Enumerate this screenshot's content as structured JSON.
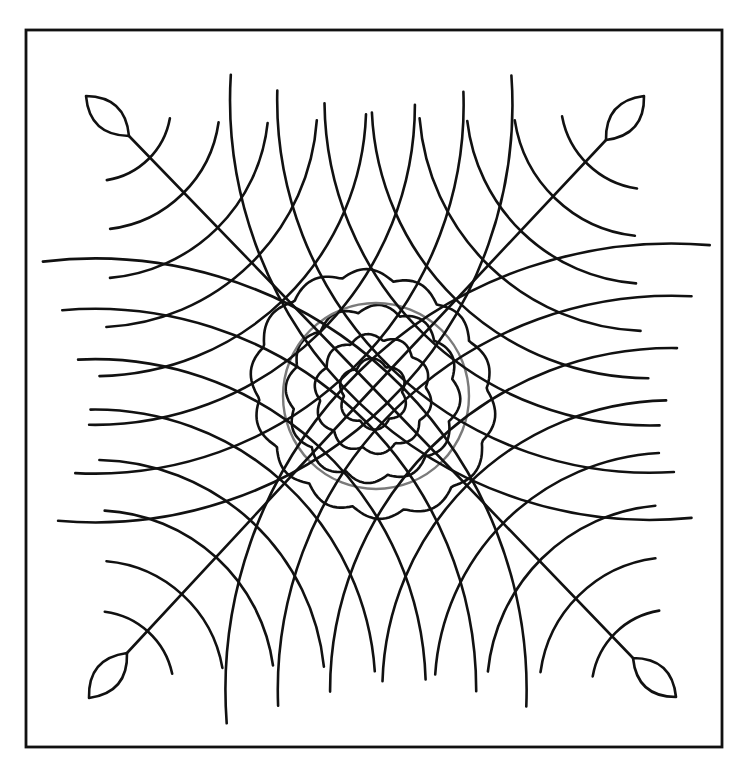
{
  "colors": {
    "line": "#111111",
    "circle": "#7a7a7a",
    "background": "#ffffff"
  },
  "motif": {
    "arms": [
      {
        "name": "top-left",
        "direction": "nw",
        "arc_count": 8
      },
      {
        "name": "top-right",
        "direction": "ne",
        "arc_count": 8
      },
      {
        "name": "bottom-left",
        "direction": "sw",
        "arc_count": 8
      },
      {
        "name": "bottom-right",
        "direction": "se",
        "arc_count": 8
      }
    ],
    "leaf_ends": 4,
    "center_circle": 1,
    "scalloped_rings": 4
  }
}
